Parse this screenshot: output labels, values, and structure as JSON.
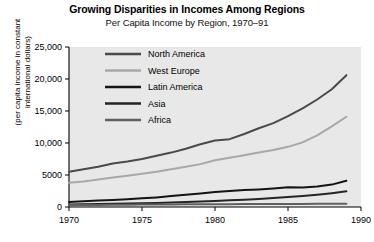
{
  "chart_data": {
    "type": "line",
    "title": "Growing Disparities in Incomes Among Regions",
    "subtitle": "Per Capita Income by Region, 1970–91",
    "xlabel": "",
    "ylabel": "(per capita income in constant international dollars)",
    "ylabel_line1": "(per capita income in constant",
    "ylabel_line2": "international dollars)",
    "xlim": [
      1970,
      1990
    ],
    "ylim": [
      0,
      25000
    ],
    "grid": false,
    "legend_position": "upper-left-inside",
    "xticks": [
      1970,
      1975,
      1980,
      1985,
      1990
    ],
    "xtick_labels": [
      "1970",
      "1975",
      "1980",
      "1985",
      "1990"
    ],
    "yticks": [
      0,
      5000,
      10000,
      15000,
      20000,
      25000
    ],
    "ytick_labels": [
      "0",
      "5000",
      "10,000",
      "15,000",
      "20,000",
      "25,000"
    ],
    "x": [
      1970,
      1971,
      1972,
      1973,
      1974,
      1975,
      1976,
      1977,
      1978,
      1979,
      1980,
      1981,
      1982,
      1983,
      1984,
      1985,
      1986,
      1987,
      1988,
      1989
    ],
    "series": [
      {
        "name": "North America",
        "color": "#4a4a4a",
        "values": [
          5500,
          5900,
          6300,
          6800,
          7100,
          7500,
          8000,
          8500,
          9100,
          9800,
          10400,
          10600,
          11400,
          12300,
          13100,
          14200,
          15400,
          16800,
          18400,
          20600
        ]
      },
      {
        "name": "West Europe",
        "color": "#a8a8a8",
        "values": [
          3800,
          4000,
          4300,
          4600,
          4900,
          5200,
          5500,
          5900,
          6300,
          6700,
          7300,
          7700,
          8100,
          8500,
          8900,
          9400,
          10100,
          11200,
          12600,
          14100
        ]
      },
      {
        "name": "Latin America",
        "color": "#141414",
        "values": [
          800,
          900,
          1000,
          1100,
          1200,
          1350,
          1500,
          1700,
          1900,
          2100,
          2350,
          2500,
          2650,
          2750,
          2900,
          3100,
          3050,
          3200,
          3500,
          4100
        ]
      },
      {
        "name": "Asia",
        "color": "#252525",
        "values": [
          400,
          430,
          460,
          500,
          540,
          580,
          640,
          700,
          780,
          860,
          950,
          1050,
          1150,
          1250,
          1400,
          1550,
          1700,
          1900,
          2150,
          2450
        ]
      },
      {
        "name": "Africa",
        "color": "#606060",
        "values": [
          300,
          310,
          320,
          340,
          360,
          380,
          400,
          410,
          420,
          430,
          440,
          445,
          450,
          455,
          460,
          470,
          480,
          490,
          500,
          520
        ]
      }
    ],
    "series_end_values": {
      "North America": 22200,
      "West Europe": 15300,
      "Latin America": 4800,
      "Asia": 2600,
      "Africa": 600
    }
  },
  "style": {
    "plot_background": "#e8e8e8",
    "page_background": "#ffffff",
    "axis_color": "#000000"
  }
}
